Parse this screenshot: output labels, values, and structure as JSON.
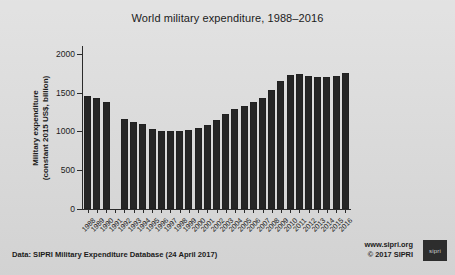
{
  "chart_data": {
    "type": "bar",
    "title": "World military expenditure, 1988–2016",
    "xlabel": "",
    "ylabel": "Military expenditure\n(constant 2015 US$, billion)",
    "ylabel_line1": "Military expenditure",
    "ylabel_line2": "(constant 2015 US$, billion)",
    "ylim": [
      0,
      2100
    ],
    "yticks": [
      0,
      500,
      1000,
      1500,
      2000
    ],
    "ytick_labels": [
      "0",
      "500",
      "1000",
      "1500",
      "2000"
    ],
    "grid": false,
    "legend": "none",
    "categories": [
      "1988",
      "1989",
      "1990",
      "1991",
      "1992",
      "1993",
      "1994",
      "1995",
      "1996",
      "1997",
      "1998",
      "1999",
      "2000",
      "2001",
      "2002",
      "2003",
      "2004",
      "2005",
      "2006",
      "2007",
      "2008",
      "2009",
      "2010",
      "2011",
      "2012",
      "2013",
      "2014",
      "2015",
      "2016"
    ],
    "values": [
      1450,
      1430,
      1380,
      null,
      1160,
      1120,
      1090,
      1030,
      1010,
      1010,
      1000,
      1020,
      1050,
      1080,
      1150,
      1230,
      1290,
      1330,
      1380,
      1430,
      1530,
      1650,
      1730,
      1740,
      1720,
      1700,
      1700,
      1710,
      1750
    ],
    "missing_note": "1991 has no data"
  },
  "footer": {
    "source": "Data: SIPRI Military Expenditure Database (24 April 2017)",
    "website": "www.sipri.org",
    "copyright": "© 2017 SIPRI",
    "logo_text": "sipri"
  },
  "colors": {
    "background": "#d9d9d9",
    "bar": "#262626",
    "axis": "#2b2b2b",
    "text": "#1b1b1b"
  }
}
